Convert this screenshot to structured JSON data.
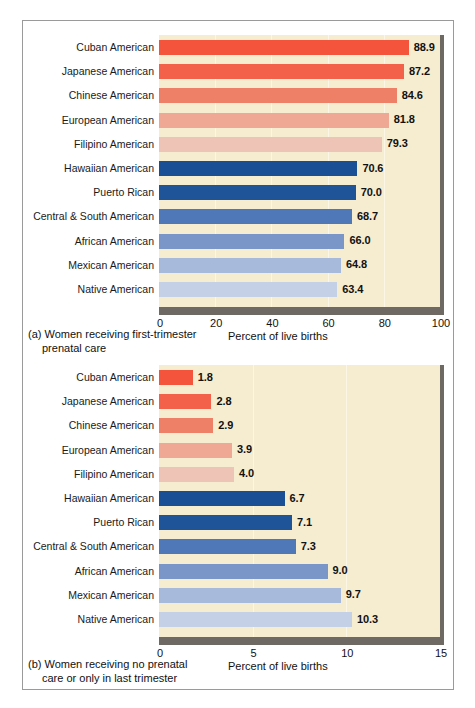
{
  "figure": {
    "background": "#f6ecd0",
    "border_color": "#9a9a9a",
    "shadow_color": "#6e6a63"
  },
  "chart_data": [
    {
      "type": "bar",
      "orientation": "horizontal",
      "panel": "a",
      "title": "",
      "caption_line1": "(a) Women receiving first-trimester",
      "caption_line2": "prenatal care",
      "xlabel": "Percent of live births",
      "ylabel": "",
      "xlim": [
        0,
        100
      ],
      "xticks": [
        0,
        20,
        40,
        60,
        80,
        100
      ],
      "xtick_labels": [
        "0",
        "20",
        "40",
        "60",
        "80",
        "100"
      ],
      "grid": true,
      "legend": "none",
      "categories": [
        "Cuban American",
        "Japanese American",
        "Chinese American",
        "European American",
        "Filipino American",
        "Hawaiian American",
        "Puerto Rican",
        "Central & South American",
        "African American",
        "Mexican American",
        "Native American"
      ],
      "values": [
        88.9,
        87.2,
        84.6,
        81.8,
        79.3,
        70.6,
        70.0,
        68.7,
        66.0,
        64.8,
        63.4
      ],
      "value_labels": [
        "88.9",
        "87.2",
        "84.6",
        "81.8",
        "79.3",
        "70.6",
        "70.0",
        "68.7",
        "66.0",
        "64.8",
        "63.4"
      ],
      "colors": [
        "#f4543c",
        "#f4614a",
        "#ee8068",
        "#efa893",
        "#edc4b5",
        "#1a4f96",
        "#1f5499",
        "#4f78b8",
        "#7a96c8",
        "#a7badc",
        "#c3d0e6"
      ]
    },
    {
      "type": "bar",
      "orientation": "horizontal",
      "panel": "b",
      "title": "",
      "caption_line1": "(b) Women receiving no prenatal",
      "caption_line2": "care or only in last trimester",
      "xlabel": "Percent of live births",
      "ylabel": "",
      "xlim": [
        0,
        15
      ],
      "xticks": [
        0,
        5,
        10,
        15
      ],
      "xtick_labels": [
        "0",
        "5",
        "10",
        "15"
      ],
      "grid": true,
      "legend": "none",
      "categories": [
        "Cuban American",
        "Japanese American",
        "Chinese American",
        "European American",
        "Filipino American",
        "Hawaiian American",
        "Puerto Rican",
        "Central & South American",
        "African American",
        "Mexican American",
        "Native American"
      ],
      "values": [
        1.8,
        2.8,
        2.9,
        3.9,
        4.0,
        6.7,
        7.1,
        7.3,
        9.0,
        9.7,
        10.3
      ],
      "value_labels": [
        "1.8",
        "2.8",
        "2.9",
        "3.9",
        "4.0",
        "6.7",
        "7.1",
        "7.3",
        "9.0",
        "9.7",
        "10.3"
      ],
      "colors": [
        "#f4543c",
        "#f4614a",
        "#ee8068",
        "#efa893",
        "#edc4b5",
        "#1a4f96",
        "#1f5499",
        "#4f78b8",
        "#7a96c8",
        "#a7badc",
        "#c3d0e6"
      ]
    }
  ]
}
